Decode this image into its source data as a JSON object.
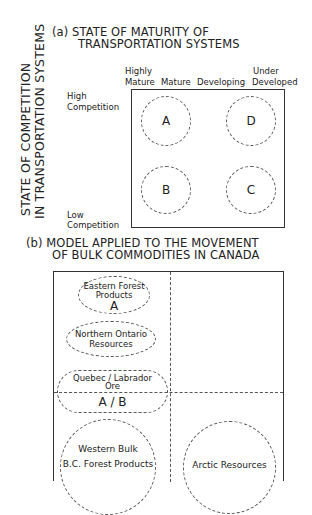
{
  "panel_a": {
    "title_line1": "(a) STATE OF MATURITY OF",
    "title_line2": "TRANSPORTATION SYSTEMS",
    "y_axis_line1": "STATE OF COMPETITION",
    "y_axis_line2": "IN TRANSPORTATION SYSTEMS",
    "y_top_label_line1": "High",
    "y_top_label_line2": "Competition",
    "y_bottom_label_line1": "Low",
    "y_bottom_label_line2": "Competition",
    "x_labels": {
      "highly_mature_line1": "Highly",
      "highly_mature_line2": "Mature",
      "mature": "Mature",
      "developing": "Developing",
      "under_developed_line1": "Under",
      "under_developed_line2": "Developed"
    },
    "quadrants": [
      {
        "id": "A",
        "label": "A"
      },
      {
        "id": "D",
        "label": "D"
      },
      {
        "id": "B",
        "label": "B"
      },
      {
        "id": "C",
        "label": "C"
      }
    ]
  },
  "panel_b": {
    "title_line1": "(b) MODEL APPLIED TO THE MOVEMENT",
    "title_line2": "OF BULK COMMODITIES IN CANADA",
    "regions": [
      {
        "name": "eastern-forest-products",
        "line1": "Eastern Forest",
        "line2": "Products",
        "quadrant": "A"
      },
      {
        "name": "northern-ontario-resources",
        "line1": "Northern Ontario",
        "line2": "Resources"
      },
      {
        "name": "quebec-labrador-ore",
        "line1": "Quebec / Labrador",
        "line2": "Ore",
        "quadrant": "A / B"
      },
      {
        "name": "western-bulk",
        "line1": "Western Bulk",
        "line2": "B.C. Forest Products"
      },
      {
        "name": "arctic-resources",
        "line1": "Arctic Resources"
      }
    ]
  }
}
